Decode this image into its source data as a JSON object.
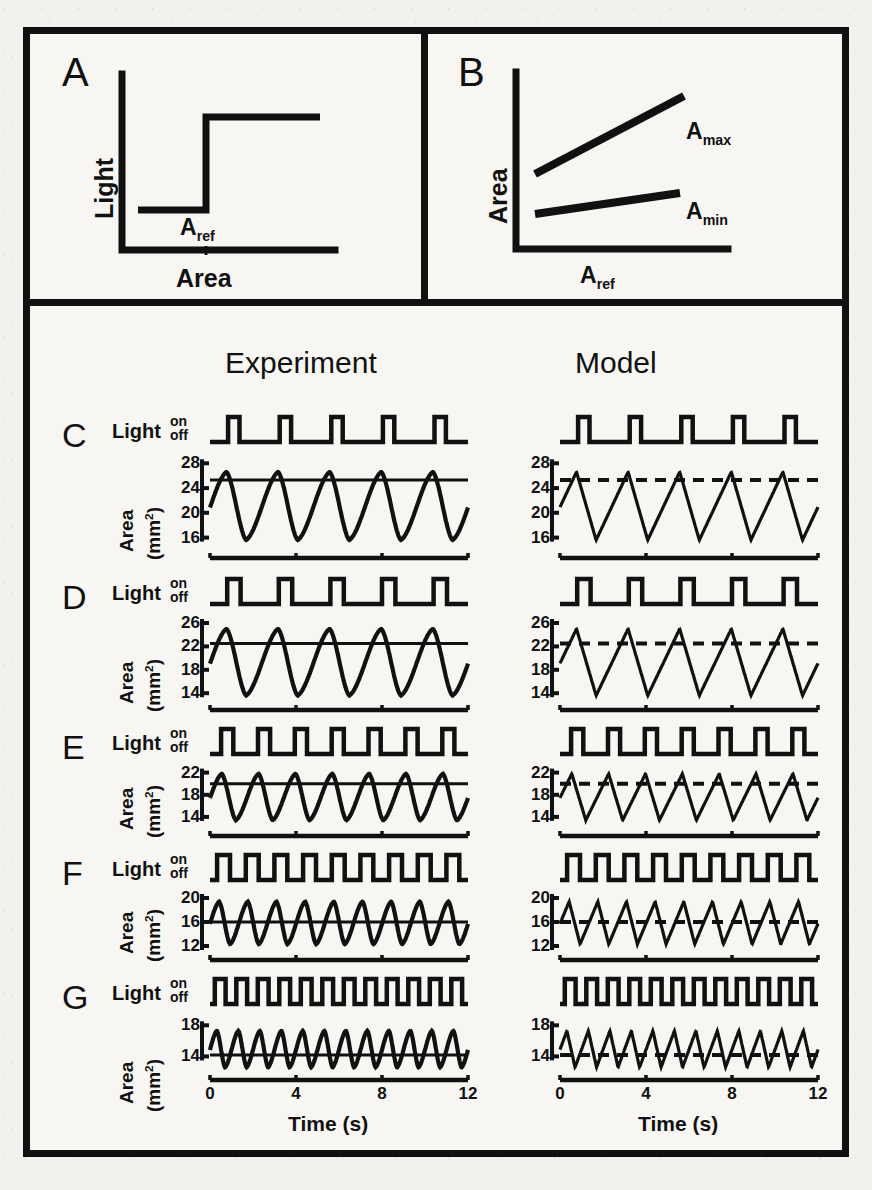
{
  "figure": {
    "background_color": "#f2f1ed",
    "ink_color": "#111111",
    "column_headers": {
      "experiment": "Experiment",
      "model": "Model"
    }
  },
  "panel_a": {
    "letter": "A",
    "ylabel": "Light",
    "xlabel": "Area",
    "annotation": "A",
    "annotation_sub": "ref",
    "description": "step function: light is low below A_ref and high above A_ref"
  },
  "panel_b": {
    "letter": "B",
    "ylabel": "Area",
    "xlabel": "A",
    "xlabel_sub": "ref",
    "line_upper_label": "A",
    "line_upper_sub": "max",
    "line_lower_label": "A",
    "line_lower_sub": "min",
    "description": "two rising lines, A_max steeper than A_min, versus A_ref"
  },
  "rows": [
    {
      "letter": "C",
      "light_label": "Light",
      "on_label": "on",
      "off_label": "off",
      "area_label": "Area",
      "unit_label": "(mm",
      "unit_sup": "2",
      "unit_tail": ")",
      "yticks": [
        16,
        20,
        24,
        28
      ],
      "ylim": [
        14,
        29.5
      ],
      "ref_area": 25.3,
      "cycles": 5,
      "duty": 0.22,
      "amin": 15.6,
      "amax": 26.6,
      "start_area": 19.8
    },
    {
      "letter": "D",
      "light_label": "Light",
      "on_label": "on",
      "off_label": "off",
      "area_label": "Area",
      "unit_label": "(mm",
      "unit_sup": "2",
      "unit_tail": ")",
      "yticks": [
        14,
        18,
        22,
        26
      ],
      "ylim": [
        12.5,
        27.2
      ],
      "ref_area": 22.5,
      "cycles": 5,
      "duty": 0.26,
      "amin": 13.6,
      "amax": 25.0,
      "start_area": 15.2
    },
    {
      "letter": "E",
      "light_label": "Light",
      "on_label": "on",
      "off_label": "off",
      "area_label": "Area",
      "unit_label": "(mm",
      "unit_sup": "2",
      "unit_tail": ")",
      "yticks": [
        14,
        18,
        22
      ],
      "ylim": [
        12.0,
        23.2
      ],
      "ref_area": 20.0,
      "cycles": 7,
      "duty": 0.33,
      "amin": 13.4,
      "amax": 21.8,
      "start_area": 17.0
    },
    {
      "letter": "F",
      "light_label": "Light",
      "on_label": "on",
      "off_label": "off",
      "area_label": "Area",
      "unit_label": "(mm",
      "unit_sup": "2",
      "unit_tail": ")",
      "yticks": [
        12,
        16,
        20
      ],
      "ylim": [
        11.0,
        21.0
      ],
      "ref_area": 16.0,
      "cycles": 9,
      "duty": 0.45,
      "amin": 12.3,
      "amax": 19.4,
      "start_area": 14.0
    },
    {
      "letter": "G",
      "light_label": "Light",
      "on_label": "on",
      "off_label": "off",
      "area_label": "Area",
      "unit_label": "(mm",
      "unit_sup": "2",
      "unit_tail": ")",
      "yticks": [
        14,
        18
      ],
      "ylim": [
        12.0,
        19.2
      ],
      "ref_area": 14.2,
      "cycles": 12,
      "duty": 0.5,
      "amin": 12.6,
      "amax": 17.3,
      "start_area": 15.6
    }
  ],
  "xaxis": {
    "ticks": [
      0,
      4,
      8,
      12
    ],
    "title": "Time (s)",
    "min": 0,
    "max": 12
  },
  "chart_data": {
    "type": "line",
    "xlabel": "Time (s)",
    "ylabel": "Area (mm2)",
    "xlim": [
      0,
      12
    ],
    "grid": false,
    "legend": [
      "Experiment",
      "Model"
    ],
    "legend_position": "top",
    "panels": [
      {
        "id": "A",
        "type": "line",
        "xlabel": "Area",
        "ylabel": "Light",
        "annotation": "Aref",
        "series": [
          {
            "name": "light-step",
            "x": [
              0,
              0.45,
              0.45,
              1.0
            ],
            "y": [
              0.25,
              0.25,
              0.82,
              0.82
            ]
          }
        ]
      },
      {
        "id": "B",
        "type": "line",
        "xlabel": "Aref",
        "ylabel": "Area",
        "series": [
          {
            "name": "Amax",
            "x": [
              0.08,
              0.86
            ],
            "y": [
              0.46,
              0.86
            ]
          },
          {
            "name": "Amin",
            "x": [
              0.08,
              0.82
            ],
            "y": [
              0.24,
              0.37
            ]
          }
        ]
      },
      {
        "id": "C",
        "cycles": 5,
        "period_s": 2.4,
        "ref_area": 25.3,
        "area_min": 15.6,
        "area_max": 26.6,
        "yticks": [
          16,
          20,
          24,
          28
        ]
      },
      {
        "id": "D",
        "cycles": 5,
        "period_s": 2.4,
        "ref_area": 22.5,
        "area_min": 13.6,
        "area_max": 25.0,
        "yticks": [
          14,
          18,
          22,
          26
        ]
      },
      {
        "id": "E",
        "cycles": 7,
        "period_s": 1.7,
        "ref_area": 20.0,
        "area_min": 13.4,
        "area_max": 21.8,
        "yticks": [
          14,
          18,
          22
        ]
      },
      {
        "id": "F",
        "cycles": 9,
        "period_s": 1.33,
        "ref_area": 16.0,
        "area_min": 12.3,
        "area_max": 19.4,
        "yticks": [
          12,
          16,
          20
        ]
      },
      {
        "id": "G",
        "cycles": 12,
        "period_s": 1.0,
        "ref_area": 14.2,
        "area_min": 12.6,
        "area_max": 17.3,
        "yticks": [
          14,
          18
        ]
      }
    ]
  }
}
